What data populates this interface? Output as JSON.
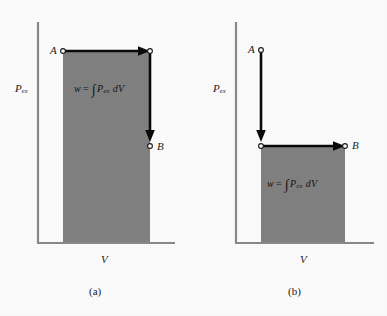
{
  "figure": {
    "background_color": "#fefefe",
    "shade_color": "#828282",
    "axis_color": "#8a8a8a",
    "path_color": "#0a0a0a"
  },
  "panels": [
    {
      "id": "a",
      "caption": "(a)",
      "axis_y_label": "P",
      "axis_y_subscript": "ex",
      "axis_x_label": "V",
      "formula": {
        "lhs": "w",
        "operator": "=",
        "integral": "∫",
        "integrand": "P",
        "integrand_subscript": "ex",
        "differential": "dV"
      },
      "points": [
        {
          "label": "A",
          "x": 63,
          "y": 51
        },
        {
          "label": "B",
          "x": 150,
          "y": 146
        }
      ],
      "path_description": "horizontal-then-vertical",
      "shade_rect": {
        "x": 63,
        "y": 51,
        "width": 87,
        "height": 192
      }
    },
    {
      "id": "b",
      "caption": "(b)",
      "axis_y_label": "P",
      "axis_y_subscript": "ex",
      "axis_x_label": "V",
      "formula": {
        "lhs": "w",
        "operator": "=",
        "integral": "∫",
        "integrand": "P",
        "integrand_subscript": "ex",
        "differential": "dV"
      },
      "points": [
        {
          "label": "A",
          "x": 68,
          "y": 50
        },
        {
          "label": "B",
          "x": 152,
          "y": 146
        }
      ],
      "path_description": "vertical-then-horizontal",
      "shade_rect": {
        "x": 68,
        "y": 146,
        "width": 84,
        "height": 97
      }
    }
  ]
}
